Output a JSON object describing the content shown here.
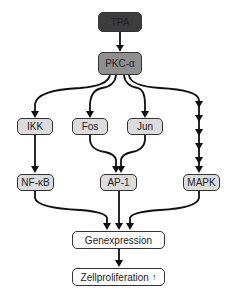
{
  "diagram": {
    "nodes": {
      "tpa": {
        "label": "TPA"
      },
      "pkc": {
        "label": "PKC-α"
      },
      "ikk": {
        "label": "IKK"
      },
      "fos": {
        "label": "Fos"
      },
      "jun": {
        "label": "Jun"
      },
      "nfkb": {
        "label": "NF-κB"
      },
      "ap1": {
        "label": "AP-1"
      },
      "mapk": {
        "label": "MAPK"
      },
      "genexpression": {
        "label": "Genexpression"
      },
      "zellproliferation": {
        "label": "Zellproliferation",
        "indicator": "↑"
      }
    },
    "edges": [
      {
        "from": "TPA",
        "to": "PKC-α"
      },
      {
        "from": "PKC-α",
        "to": "IKK"
      },
      {
        "from": "PKC-α",
        "to": "Fos"
      },
      {
        "from": "PKC-α",
        "to": "Jun"
      },
      {
        "from": "PKC-α",
        "to": "MAPK",
        "style": "multi-step"
      },
      {
        "from": "IKK",
        "to": "NF-κB"
      },
      {
        "from": "Fos",
        "to": "AP-1"
      },
      {
        "from": "Jun",
        "to": "AP-1"
      },
      {
        "from": "NF-κB",
        "to": "Genexpression"
      },
      {
        "from": "AP-1",
        "to": "Genexpression"
      },
      {
        "from": "MAPK",
        "to": "Genexpression"
      },
      {
        "from": "Genexpression",
        "to": "Zellproliferation"
      }
    ],
    "colors": {
      "dark": "#3d3d3d",
      "mid": "#8f8f8f",
      "light": "#dcdcdc",
      "line": "#111111"
    }
  }
}
